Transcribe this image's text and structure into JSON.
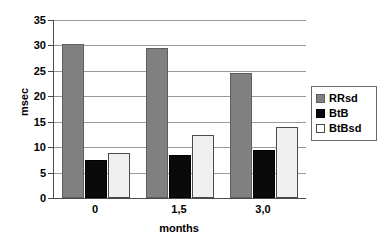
{
  "chart_data": {
    "type": "bar",
    "title": "",
    "xlabel": "months",
    "ylabel": "msec",
    "categories": [
      "0",
      "1,5",
      "3,0"
    ],
    "series": [
      {
        "name": "RRsd",
        "color": "#808080",
        "values": [
          30.2,
          29.5,
          24.6
        ]
      },
      {
        "name": "BtB",
        "color": "#000000",
        "values": [
          7.4,
          8.5,
          9.4
        ]
      },
      {
        "name": "BtBsd",
        "color": "#f0f0f0",
        "values": [
          8.8,
          12.3,
          14.0
        ]
      }
    ],
    "ylim": [
      0,
      35
    ],
    "yticks": [
      0,
      5,
      10,
      15,
      20,
      25,
      30,
      35
    ],
    "ytick_labels": [
      "0",
      "5",
      "10",
      "15",
      "20",
      "25",
      "30",
      "35"
    ],
    "grid": true,
    "grid_axis": "y",
    "legend_position": "right",
    "legend_entries": [
      "RRsd",
      "BtB",
      "BtBsd"
    ]
  },
  "axes": {
    "y_title": "msec",
    "x_title": "months"
  },
  "colors": {
    "series_rrsd": "#808080",
    "series_btb": "#000000",
    "series_btbsd": "#f0f0f0",
    "axis": "#4a4a4a",
    "gridline": "#9a9a9a",
    "background": "#ffffff"
  }
}
